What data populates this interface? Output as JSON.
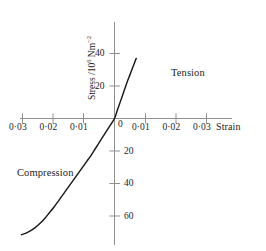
{
  "figure": {
    "background_color": "#ffffff",
    "line_color": "#1a1a1a",
    "axis_color": "#8a8a8a"
  },
  "axes": {
    "y_label_prefix": "Stress /10",
    "y_label_exp1": "6",
    "y_label_mid": " Nm",
    "y_label_exp2": "−2",
    "x_label": "Strain",
    "origin_label": "0"
  },
  "annotations": {
    "tension": "Tension",
    "compression": "Compression"
  },
  "ticks": {
    "x_left": [
      "0·03",
      "0·02",
      "0·01"
    ],
    "x_right": [
      "0·01",
      "0·02",
      "0·03"
    ],
    "y_positive": [
      "40",
      "20"
    ],
    "y_negative": [
      "20",
      "40",
      "60"
    ]
  },
  "chart_data": {
    "type": "line",
    "title": "",
    "subtitle": "",
    "xlabel": "Strain",
    "ylabel": "Stress /10^6 Nm^-2",
    "xlim": [
      -0.035,
      0.035
    ],
    "ylim": [
      -75,
      50
    ],
    "grid": false,
    "legend": null,
    "x_tick_values": [
      -0.03,
      -0.02,
      -0.01,
      0,
      0.01,
      0.02,
      0.03
    ],
    "x_tick_labels": [
      "0·03",
      "0·02",
      "0·01",
      "0",
      "0·01",
      "0·02",
      "0·03"
    ],
    "y_tick_values": [
      40,
      20,
      -20,
      -40,
      -60
    ],
    "y_tick_labels": [
      "40",
      "20",
      "20",
      "40",
      "60"
    ],
    "annotations": [
      {
        "text": "Tension",
        "x": 0.018,
        "y": 30
      },
      {
        "text": "Compression",
        "x": -0.024,
        "y": -43
      }
    ],
    "series": [
      {
        "name": "stress-strain curve",
        "x": [
          -0.03,
          -0.0285,
          -0.027,
          -0.0255,
          -0.024,
          -0.0225,
          -0.021,
          -0.0195,
          -0.018,
          -0.0165,
          -0.015,
          -0.0135,
          -0.012,
          -0.0105,
          -0.009,
          -0.0075,
          -0.006,
          -0.0045,
          -0.003,
          -0.0015,
          0.0,
          0.001,
          0.002,
          0.003,
          0.004,
          0.005,
          0.006,
          0.007
        ],
        "y": [
          -71.5,
          -70.5,
          -69.0,
          -67.0,
          -64.5,
          -61.5,
          -58.0,
          -54.5,
          -50.5,
          -46.5,
          -42.5,
          -38.5,
          -34.5,
          -30.5,
          -26.5,
          -22.5,
          -18.0,
          -13.5,
          -9.0,
          -4.5,
          0.0,
          5.5,
          11.0,
          16.5,
          22.0,
          27.0,
          32.0,
          37.0
        ]
      }
    ]
  }
}
